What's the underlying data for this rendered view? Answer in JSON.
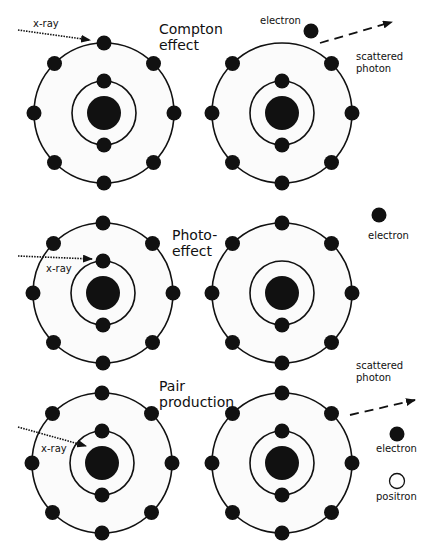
{
  "diagram": {
    "panels": [
      {
        "id": "compton",
        "title_line1": "Compton",
        "title_line2": "effect",
        "incoming_label": "x-ray",
        "outgoing_labels": {
          "electron": "electron",
          "photon_line1": "scattered",
          "photon_line2": "photon"
        }
      },
      {
        "id": "photo",
        "title_line1": "Photo-",
        "title_line2": "effect",
        "incoming_label": "x-ray",
        "outgoing_labels": {
          "electron": "electron"
        }
      },
      {
        "id": "pair",
        "title_line1": "Pair",
        "title_line2": "production",
        "incoming_label": "x-ray",
        "outgoing_labels": {
          "photon_line1": "scattered",
          "photon_line2": "photon",
          "electron": "electron",
          "positron": "positron"
        }
      }
    ],
    "colors": {
      "ink": "#111111",
      "background": "#ffffff",
      "atom_fill": "#fbfbfb"
    }
  }
}
